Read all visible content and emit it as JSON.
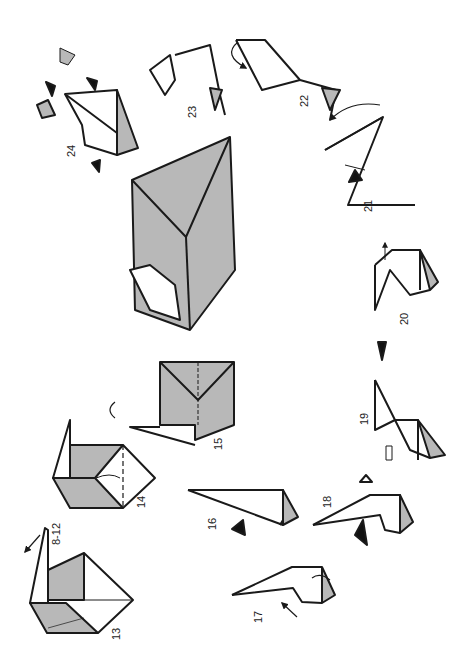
{
  "diagram": {
    "type": "origami instruction sequence (rotated 90 degrees)",
    "colors": {
      "line": "#1a1a1a",
      "paper_shade": "#b8b8b8",
      "background": "#ffffff",
      "push_arrow": "#111111"
    },
    "steps": [
      {
        "id": "8-12",
        "label": "8-12",
        "note": "repeat arrow"
      },
      {
        "id": "13",
        "label": "13"
      },
      {
        "id": "14",
        "label": "14"
      },
      {
        "id": "15",
        "label": "15"
      },
      {
        "id": "16",
        "label": "16"
      },
      {
        "id": "17",
        "label": "17"
      },
      {
        "id": "18",
        "label": "18"
      },
      {
        "id": "19",
        "label": "19"
      },
      {
        "id": "20",
        "label": "20"
      },
      {
        "id": "21",
        "label": "21"
      },
      {
        "id": "22",
        "label": "22"
      },
      {
        "id": "23",
        "label": "23"
      },
      {
        "id": "24",
        "label": "24"
      }
    ],
    "symbols": {
      "turn_over": "turn-over-arrows",
      "push": "black-triangle",
      "open": "hollow-arrow"
    }
  }
}
